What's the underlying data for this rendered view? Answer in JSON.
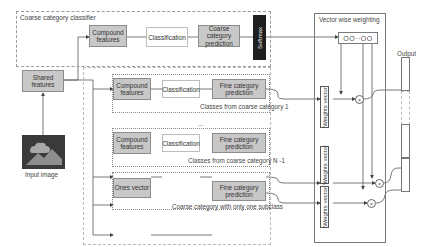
{
  "coarse_classifier": {
    "title": "Coarse category classifier",
    "compound_features": "Compound features",
    "classification": "Classification",
    "prediction": "Coarse category prediction",
    "softmax": "Softmax"
  },
  "shared_features": "Shared features",
  "input_image": {
    "label": "Input image",
    "icon": "image-icon"
  },
  "branches": [
    {
      "compound_features": "Compound features",
      "classification": "Classification",
      "prediction": "Fine category prediction",
      "caption": "Classes from coarse category 1"
    },
    {
      "compound_features": "Compound features",
      "classification": "Classification",
      "prediction": "Fine category prediction",
      "caption": "Classes from coarse category N -1"
    },
    {
      "ones_vector": "Ones vector",
      "prediction": "Fine category prediction",
      "caption": "Coarse category with only one subclass"
    }
  ],
  "ellipsis": "...",
  "weighting": {
    "title": "Vector wise weighting",
    "weights_vector": "Weights vector",
    "vector_dots": "OO··OO",
    "multiply_symbol": "×"
  },
  "output": {
    "label": "Output"
  },
  "colors": {
    "box_fill": "#c8c8c8",
    "softmax_fill": "#1e1e1e",
    "line": "#555555"
  }
}
